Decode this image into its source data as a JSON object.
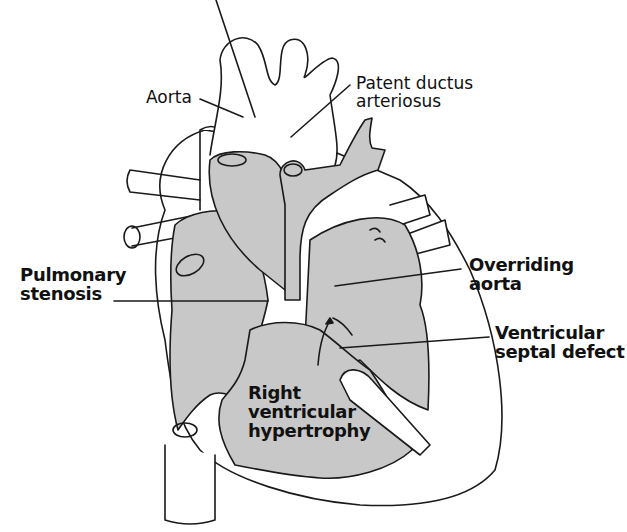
{
  "diagram": {
    "fill_color": "#c8c8c8",
    "outline_color": "#1a1a1a",
    "labels": [
      {
        "id": "aorta",
        "lines": [
          "Aorta"
        ],
        "weight": "regular"
      },
      {
        "id": "patent-ductus-arteriosus",
        "lines": [
          "Patent ductus",
          "arteriosus"
        ],
        "weight": "regular"
      },
      {
        "id": "pulmonary-stenosis",
        "lines": [
          "Pulmonary",
          "stenosis"
        ],
        "weight": "bold"
      },
      {
        "id": "overriding-aorta",
        "lines": [
          "Overriding",
          "aorta"
        ],
        "weight": "bold"
      },
      {
        "id": "ventricular-septal-defect",
        "lines": [
          "Ventricular",
          "septal defect"
        ],
        "weight": "bold"
      },
      {
        "id": "right-ventricular-hypertrophy",
        "lines": [
          "Right",
          "ventricular",
          "hypertrophy"
        ],
        "weight": "bold"
      }
    ]
  }
}
